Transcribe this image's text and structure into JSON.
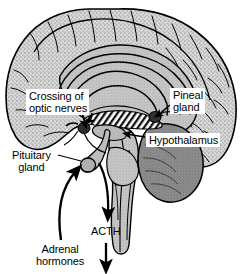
{
  "figure": {
    "labels": {
      "crossing_optic_nerves_line1": "Crossing of",
      "crossing_optic_nerves_line2": "optic nerves",
      "pineal_gland_line1": "Pineal",
      "pineal_gland_line2": "gland",
      "hypothalamus": "Hypothalamus",
      "pituitary_gland_line1": "Pituitary",
      "pituitary_gland_line2": "gland",
      "acth": "ACTH",
      "adrenal_hormones_line1": "Adrenal",
      "adrenal_hormones_line2": "hormones"
    },
    "structures": [
      "cerebral-cortex",
      "corpus-callosum",
      "optic-chiasm",
      "thalamus",
      "pineal-gland",
      "hypothalamus",
      "pituitary-gland",
      "brainstem",
      "cerebellum"
    ],
    "arrows": [
      "acth-descending-arrow",
      "acth-output-arrow",
      "adrenal-hormones-feedback-arrow",
      "crossing-optic-nerves-leader-arrow",
      "pineal-gland-leader-arrow",
      "hypothalamus-leader-arrow",
      "pituitary-gland-leader-line"
    ],
    "colors": {
      "background": "#ffffff",
      "outline": "#000000",
      "cortex_fill": "#d8d8d8",
      "inner_brain_fill": "#c9c9c9",
      "brainstem_fill": "#b4b4b4",
      "cerebellum_fill": "#8a8a8a",
      "pituitary_fill": "#bdbdbd",
      "label_box": "#ffffff"
    }
  }
}
